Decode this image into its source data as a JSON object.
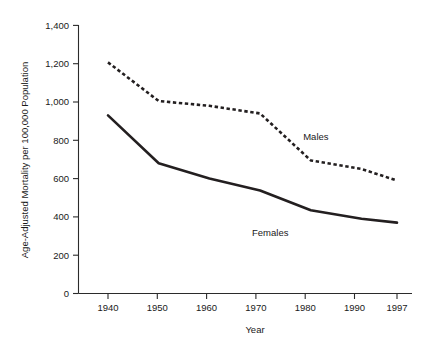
{
  "chart_data": {
    "type": "line",
    "title": "",
    "xlabel": "Year",
    "ylabel": "Age-Adjusted Mortality per 100,000 Population",
    "x": [
      1940,
      1950,
      1960,
      1970,
      1980,
      1990,
      1997
    ],
    "xtick_labels": [
      "1940",
      "1950",
      "1960",
      "1970",
      "1980",
      "1990",
      "1997"
    ],
    "ytick_labels": [
      "0",
      "200",
      "400",
      "600",
      "800",
      "1,000",
      "1,200",
      "1,400"
    ],
    "ytick_values": [
      0,
      200,
      400,
      600,
      800,
      1000,
      1200,
      1400
    ],
    "ylim": [
      0,
      1400
    ],
    "xlim": [
      1940,
      1997
    ],
    "grid": false,
    "legend_position": "inline-annotations",
    "series": [
      {
        "name": "Males",
        "style": "dashed",
        "color": "#231f20",
        "values": [
          1207,
          1005,
          980,
          940,
          695,
          650,
          590
        ],
        "label": "Males",
        "label_x": 1981,
        "label_y": 800
      },
      {
        "name": "Females",
        "style": "solid",
        "color": "#231f20",
        "values": [
          930,
          680,
          600,
          538,
          435,
          390,
          370
        ],
        "label": "Females",
        "label_x": 1972,
        "label_y": 300
      }
    ]
  },
  "axes": {
    "y_axis_title": "Age-Adjusted Mortality per 100,000 Population",
    "x_axis_title": "Year"
  }
}
